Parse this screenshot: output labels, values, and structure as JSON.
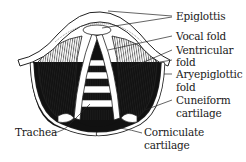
{
  "labels": {
    "epiglottis": "Epiglottis",
    "vocal_fold": "Vocal fold",
    "ventricular_fold_1": "Ventricular",
    "ventricular_fold_2": "fold",
    "aryepiglottic_fold_1": "Aryepiglottic",
    "aryepiglottic_fold_2": "fold",
    "cuneiform_1": "Cuneiform",
    "cuneiform_2": "cartilage",
    "trachea": "Trachea",
    "corniculate_1": "Corniculate",
    "corniculate_2": "cartilage"
  },
  "colors": {
    "ink": "#1a1a1a",
    "background": "#ffffff",
    "shadow": "#111111"
  }
}
